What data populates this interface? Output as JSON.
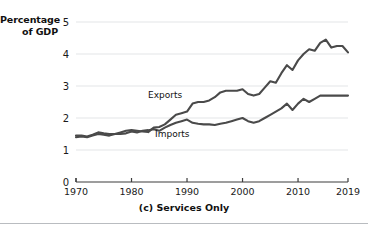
{
  "figure": {
    "y_axis_title": "Percentage of GDP",
    "caption": "(c) Services Only",
    "export_label": "Exports",
    "import_label": "Imports"
  },
  "chart_data": {
    "type": "line",
    "title": "(c) Services Only",
    "xlabel": "",
    "ylabel": "Percentage of GDP",
    "xlim": [
      1970,
      2019
    ],
    "ylim": [
      0,
      5
    ],
    "ytick_labels": [
      "0",
      "1",
      "2",
      "3",
      "4",
      "5"
    ],
    "yticks": [
      0,
      1,
      2,
      3,
      4,
      5
    ],
    "xtick_labels": [
      "1970",
      "1980",
      "1990",
      "2000",
      "2010",
      "2019"
    ],
    "xticks": [
      1970,
      1980,
      1990,
      2000,
      2010,
      2019
    ],
    "grid": "horizontal",
    "legend": "inline-annotations",
    "line_color": "#4a4a4a",
    "x": [
      1970,
      1971,
      1972,
      1973,
      1974,
      1975,
      1976,
      1977,
      1978,
      1979,
      1980,
      1981,
      1982,
      1983,
      1984,
      1985,
      1986,
      1987,
      1988,
      1989,
      1990,
      1991,
      1992,
      1993,
      1994,
      1995,
      1996,
      1997,
      1998,
      1999,
      2000,
      2001,
      2002,
      2003,
      2004,
      2005,
      2006,
      2007,
      2008,
      2009,
      2010,
      2011,
      2012,
      2013,
      2014,
      2015,
      2016,
      2017,
      2018,
      2019
    ],
    "series": [
      {
        "name": "Exports",
        "values": [
          1.45,
          1.45,
          1.42,
          1.48,
          1.55,
          1.52,
          1.5,
          1.5,
          1.55,
          1.6,
          1.62,
          1.6,
          1.58,
          1.56,
          1.7,
          1.72,
          1.8,
          1.95,
          2.1,
          2.15,
          2.2,
          2.45,
          2.5,
          2.5,
          2.55,
          2.65,
          2.8,
          2.85,
          2.85,
          2.85,
          2.9,
          2.75,
          2.7,
          2.75,
          2.95,
          3.15,
          3.1,
          3.4,
          3.65,
          3.5,
          3.8,
          4.0,
          4.15,
          4.1,
          4.35,
          4.45,
          4.2,
          4.25,
          4.25,
          4.05
        ]
      },
      {
        "name": "Imports",
        "values": [
          1.4,
          1.42,
          1.4,
          1.45,
          1.5,
          1.48,
          1.45,
          1.5,
          1.5,
          1.52,
          1.58,
          1.55,
          1.6,
          1.62,
          1.65,
          1.6,
          1.7,
          1.78,
          1.85,
          1.9,
          1.95,
          1.85,
          1.82,
          1.8,
          1.8,
          1.78,
          1.82,
          1.85,
          1.9,
          1.95,
          2.0,
          1.9,
          1.85,
          1.9,
          2.0,
          2.1,
          2.2,
          2.3,
          2.45,
          2.25,
          2.45,
          2.6,
          2.5,
          2.6,
          2.7,
          2.7,
          2.7,
          2.7,
          2.7,
          2.7
        ]
      }
    ]
  }
}
